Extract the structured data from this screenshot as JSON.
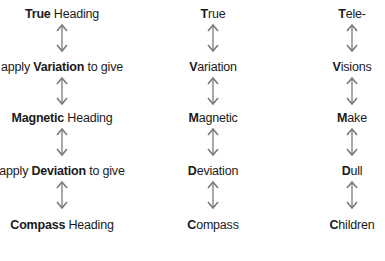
{
  "colors": {
    "text": "#1a1a1a",
    "arrow": "#7a7a7a"
  },
  "columns": [
    {
      "name": "explanation",
      "items": [
        {
          "pre": "",
          "bold": "True",
          "post": " Heading"
        },
        {
          "pre": "apply ",
          "bold": "Variation",
          "post": " to give"
        },
        {
          "pre": "",
          "bold": "Magnetic",
          "post": " Heading"
        },
        {
          "pre": "apply ",
          "bold": "Deviation",
          "post": " to give"
        },
        {
          "pre": "",
          "bold": "Compass",
          "post": " Heading"
        }
      ]
    },
    {
      "name": "terms",
      "items": [
        {
          "pre": "",
          "bold": "T",
          "post": "rue"
        },
        {
          "pre": "",
          "bold": "V",
          "post": "ariation"
        },
        {
          "pre": "",
          "bold": "M",
          "post": "agnetic"
        },
        {
          "pre": "",
          "bold": "D",
          "post": "eviation"
        },
        {
          "pre": "",
          "bold": "C",
          "post": "ompass"
        }
      ]
    },
    {
      "name": "mnemonic",
      "items": [
        {
          "pre": "",
          "bold": "T",
          "post": "ele-"
        },
        {
          "pre": "",
          "bold": "V",
          "post": "isions"
        },
        {
          "pre": "",
          "bold": "M",
          "post": "ake"
        },
        {
          "pre": "",
          "bold": "D",
          "post": "ull"
        },
        {
          "pre": "",
          "bold": "C",
          "post": "hildren"
        }
      ]
    }
  ],
  "arrow_icon": "double-headed-vertical-arrow"
}
